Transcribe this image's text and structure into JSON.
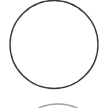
{
  "canvas": {
    "width": 106,
    "height": 108,
    "background_color": "#ffffff",
    "description": "Minimal line drawing: a large thin circle outline on a plain white background, clipped at the top edge, with the faint top arc of a second circle entering from the bottom edge."
  },
  "shapes": {
    "primary_circle": {
      "name": "Circle outline",
      "type": "circle",
      "cx": 54,
      "cy": 44.5,
      "r": 44,
      "stroke_color": "#3a3a3c",
      "stroke_width": 1.4,
      "fill": "none",
      "clipped_edge": "top"
    },
    "secondary_arc": {
      "name": "Partial circle arc",
      "type": "arc",
      "cx": 58,
      "cy": 150,
      "r": 46,
      "stroke_color": "#8e8e92",
      "stroke_width": 1.3,
      "fill": "none",
      "clipped_edge": "bottom"
    }
  },
  "colors": {
    "stroke": "#3a3a3c",
    "faint_stroke": "#8e8e92",
    "background": "#ffffff"
  }
}
